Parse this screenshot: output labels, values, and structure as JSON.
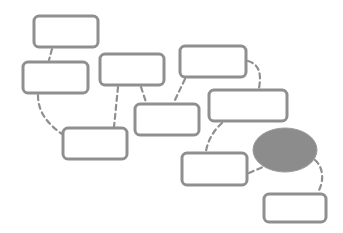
{
  "diagram": {
    "type": "flow-diagram",
    "colors": {
      "box_stroke": "#8f8f8f",
      "box_fill": "#ffffff",
      "highlight_fill": "#8c8c8c",
      "connector": "#8f8f8f",
      "background": "#ffffff"
    },
    "nodes": [
      {
        "id": "A",
        "shape": "rounded-rect",
        "label": "",
        "x": 34,
        "y": 16,
        "w": 64,
        "h": 31
      },
      {
        "id": "B",
        "shape": "rounded-rect",
        "label": "",
        "x": 23,
        "y": 62,
        "w": 65,
        "h": 31
      },
      {
        "id": "C",
        "shape": "rounded-rect",
        "label": "",
        "x": 100,
        "y": 54,
        "w": 64,
        "h": 31
      },
      {
        "id": "D",
        "shape": "rounded-rect",
        "label": "",
        "x": 180,
        "y": 46,
        "w": 66,
        "h": 31
      },
      {
        "id": "E",
        "shape": "rounded-rect",
        "label": "",
        "x": 209,
        "y": 90,
        "w": 78,
        "h": 31
      },
      {
        "id": "F",
        "shape": "rounded-rect",
        "label": "",
        "x": 135,
        "y": 104,
        "w": 64,
        "h": 31
      },
      {
        "id": "G",
        "shape": "rounded-rect",
        "label": "",
        "x": 63,
        "y": 128,
        "w": 64,
        "h": 31
      },
      {
        "id": "H",
        "shape": "rounded-rect",
        "label": "",
        "x": 182,
        "y": 153,
        "w": 65,
        "h": 32
      },
      {
        "id": "X",
        "shape": "ellipse",
        "label": "",
        "cx": 285,
        "cy": 150,
        "rx": 32,
        "ry": 22,
        "filled": true
      },
      {
        "id": "I",
        "shape": "rounded-rect",
        "label": "",
        "x": 264,
        "y": 194,
        "w": 62,
        "h": 28
      }
    ],
    "edges": [
      {
        "from": "A",
        "to": "B",
        "style": "dashed"
      },
      {
        "from": "B",
        "to": "G",
        "style": "dashed"
      },
      {
        "from": "C",
        "to": "G",
        "style": "dashed"
      },
      {
        "from": "C",
        "to": "F",
        "style": "dashed"
      },
      {
        "from": "D",
        "to": "F",
        "style": "dashed"
      },
      {
        "from": "D",
        "to": "E",
        "style": "dashed"
      },
      {
        "from": "E",
        "to": "H",
        "style": "dashed"
      },
      {
        "from": "H",
        "to": "X",
        "style": "dashed"
      },
      {
        "from": "X",
        "to": "I",
        "style": "dashed"
      }
    ]
  }
}
